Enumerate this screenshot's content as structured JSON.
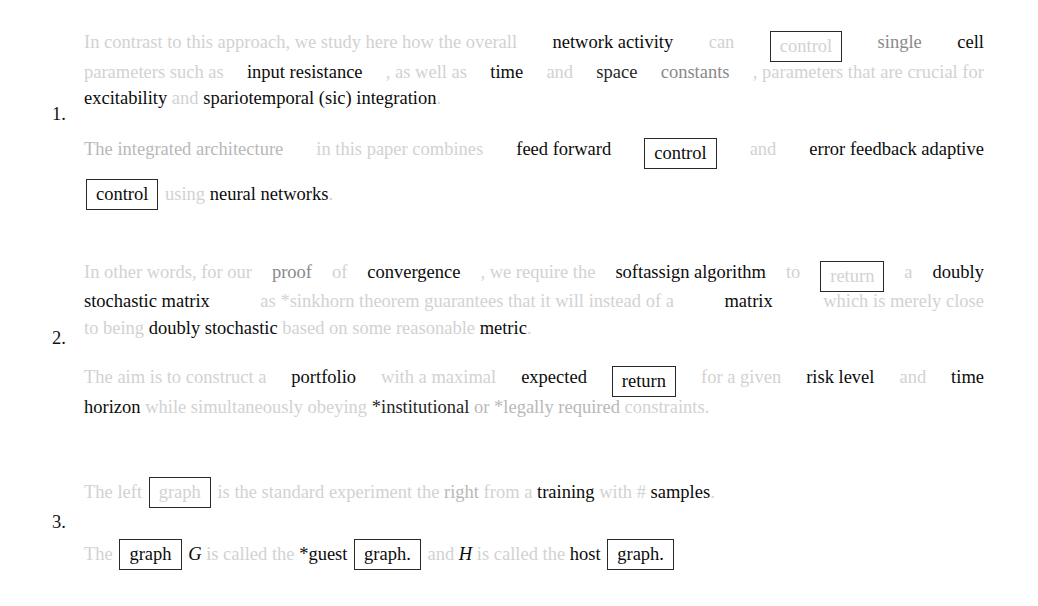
{
  "figure": {
    "examples": [
      {
        "number": "1.",
        "sentences": [
          {
            "lines": [
              [
                {
                  "t": "In contrast to this approach, we study here how the overall",
                  "g": 0
                },
                {
                  "t": "network activity",
                  "g": 5
                },
                {
                  "t": "can",
                  "g": 0
                },
                {
                  "t": "control",
                  "g": 0,
                  "box": true
                },
                {
                  "t": "single",
                  "g": 2
                },
                {
                  "t": "cell",
                  "g": 5
                }
              ],
              [
                {
                  "t": "parameters such as",
                  "g": 0
                },
                {
                  "t": "input resistance",
                  "g": 5
                },
                {
                  "t": ", as well as",
                  "g": 0
                },
                {
                  "t": "time",
                  "g": 5
                },
                {
                  "t": "and",
                  "g": 0
                },
                {
                  "t": "space",
                  "g": 4
                },
                {
                  "t": "constants",
                  "g": 2
                },
                {
                  "t": ", parameters that are crucial for",
                  "g": 0
                }
              ],
              [
                {
                  "t": "excitability",
                  "g": 5
                },
                {
                  "t": "and",
                  "g": 0
                },
                {
                  "t": "spariotemporal (sic) integration",
                  "g": 5
                },
                {
                  "t": ".",
                  "g": 0
                }
              ]
            ]
          },
          {
            "lines": [
              [
                {
                  "t": "The integrated architecture",
                  "g": 1
                },
                {
                  "t": "in this paper combines",
                  "g": 0
                },
                {
                  "t": "feed forward",
                  "g": 5
                },
                {
                  "t": "control",
                  "g": 5,
                  "box": true
                },
                {
                  "t": "and",
                  "g": 0
                },
                {
                  "t": "error feedback adaptive",
                  "g": 5
                }
              ],
              [
                {
                  "t": "control",
                  "g": 5,
                  "box": true
                },
                {
                  "t": "using",
                  "g": 0
                },
                {
                  "t": "neural networks",
                  "g": 5
                },
                {
                  "t": ".",
                  "g": 0
                }
              ]
            ]
          }
        ]
      },
      {
        "number": "2.",
        "sentences": [
          {
            "lines": [
              [
                {
                  "t": "In other words, for our",
                  "g": 0
                },
                {
                  "t": "proof",
                  "g": 2
                },
                {
                  "t": "of",
                  "g": 0
                },
                {
                  "t": "convergence",
                  "g": 5
                },
                {
                  "t": ", we require the",
                  "g": 0
                },
                {
                  "t": "softassign algorithm",
                  "g": 5
                },
                {
                  "t": "to",
                  "g": 0
                },
                {
                  "t": "return",
                  "g": 0,
                  "box": true
                },
                {
                  "t": "a",
                  "g": 0
                },
                {
                  "t": "doubly",
                  "g": 5
                }
              ],
              [
                {
                  "t": "stochastic matrix",
                  "g": 5
                },
                {
                  "t": "as *sinkhorn theorem guarantees that it will instead of a",
                  "g": 0
                },
                {
                  "t": "matrix",
                  "g": 5
                },
                {
                  "t": "which is merely close",
                  "g": 0
                }
              ],
              [
                {
                  "t": "to being",
                  "g": 0
                },
                {
                  "t": "doubly stochastic",
                  "g": 5
                },
                {
                  "t": "based on some reasonable",
                  "g": 0
                },
                {
                  "t": "metric",
                  "g": 5
                },
                {
                  "t": ".",
                  "g": 0
                }
              ]
            ]
          },
          {
            "lines": [
              [
                {
                  "t": "The aim is to construct a",
                  "g": 0
                },
                {
                  "t": "portfolio",
                  "g": 5
                },
                {
                  "t": "with a maximal",
                  "g": 0
                },
                {
                  "t": "expected",
                  "g": 5
                },
                {
                  "t": "return",
                  "g": 5,
                  "box": true
                },
                {
                  "t": "for a given",
                  "g": 0
                },
                {
                  "t": "risk level",
                  "g": 5
                },
                {
                  "t": "and",
                  "g": 0
                },
                {
                  "t": "time",
                  "g": 5
                }
              ],
              [
                {
                  "t": "horizon",
                  "g": 5
                },
                {
                  "t": "while simultaneously obeying",
                  "g": 0
                },
                {
                  "t": "*institutional",
                  "g": 4
                },
                {
                  "t": "or *legally required",
                  "g": 1
                },
                {
                  "t": "constraints.",
                  "g": 0
                }
              ]
            ]
          }
        ]
      },
      {
        "number": "3.",
        "sentences": [
          {
            "lines": [
              [
                {
                  "t": "The left",
                  "g": 0
                },
                {
                  "t": "graph",
                  "g": 0,
                  "box": true
                },
                {
                  "t": "is the standard experiment the",
                  "g": 0
                },
                {
                  "t": "right",
                  "g": 1
                },
                {
                  "t": "from a",
                  "g": 0
                },
                {
                  "t": "training",
                  "g": 5
                },
                {
                  "t": "with #",
                  "g": 0
                },
                {
                  "t": "samples",
                  "g": 5
                },
                {
                  "t": ".",
                  "g": 0
                }
              ]
            ]
          },
          {
            "lines": [
              [
                {
                  "t": "The",
                  "g": 0
                },
                {
                  "t": "graph",
                  "g": 5,
                  "box": true
                },
                {
                  "t": "G",
                  "g": 5,
                  "math": true
                },
                {
                  "t": "is called the",
                  "g": 0
                },
                {
                  "t": "*guest",
                  "g": 5
                },
                {
                  "t": "graph.",
                  "g": 5,
                  "box": true
                },
                {
                  "t": "and",
                  "g": 0
                },
                {
                  "t": "H",
                  "g": 5,
                  "math": true
                },
                {
                  "t": "is called the",
                  "g": 0
                },
                {
                  "t": "host",
                  "g": 5
                },
                {
                  "t": "graph.",
                  "g": 5,
                  "box": true
                }
              ]
            ]
          }
        ]
      }
    ]
  },
  "layout": {
    "numbers": [
      {
        "label": "1.",
        "top": 104
      },
      {
        "label": "2.",
        "top": 328
      },
      {
        "label": "3.",
        "top": 512
      }
    ],
    "lines": [
      {
        "ex": 0,
        "s": 0,
        "l": 0,
        "top": 31,
        "justify": true
      },
      {
        "ex": 0,
        "s": 0,
        "l": 1,
        "top": 61,
        "justify": true
      },
      {
        "ex": 0,
        "s": 0,
        "l": 2,
        "top": 87
      },
      {
        "ex": 0,
        "s": 1,
        "l": 0,
        "top": 138,
        "justify": true
      },
      {
        "ex": 0,
        "s": 1,
        "l": 1,
        "top": 179
      },
      {
        "ex": 1,
        "s": 0,
        "l": 0,
        "top": 261,
        "justify": true
      },
      {
        "ex": 1,
        "s": 0,
        "l": 1,
        "top": 290,
        "justify": true
      },
      {
        "ex": 1,
        "s": 0,
        "l": 2,
        "top": 317
      },
      {
        "ex": 1,
        "s": 1,
        "l": 0,
        "top": 366,
        "justify": true
      },
      {
        "ex": 1,
        "s": 1,
        "l": 1,
        "top": 396
      },
      {
        "ex": 2,
        "s": 0,
        "l": 0,
        "top": 477
      },
      {
        "ex": 2,
        "s": 1,
        "l": 0,
        "top": 539
      }
    ]
  }
}
